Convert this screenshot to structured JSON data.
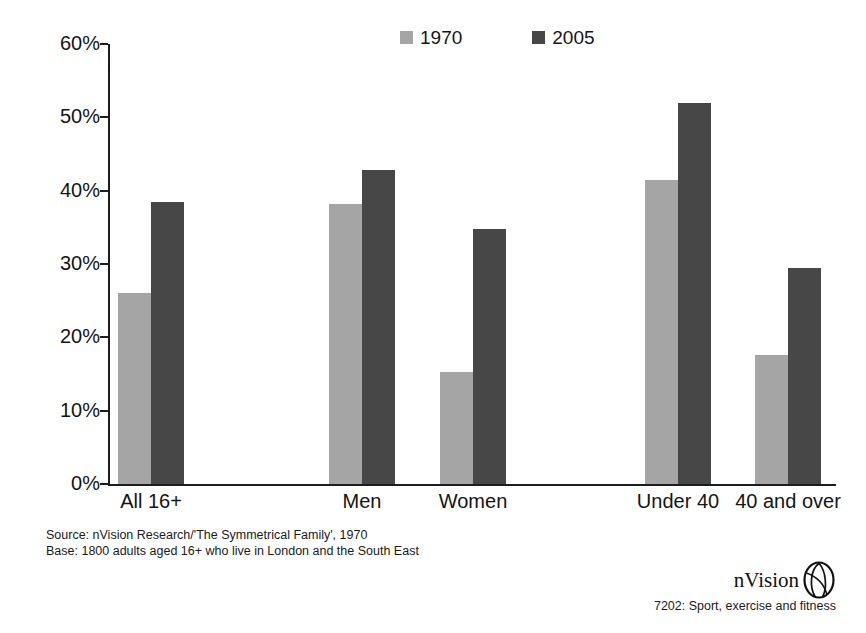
{
  "chart_data": {
    "type": "bar",
    "title": "",
    "subtitle": "",
    "xlabel": "",
    "ylabel": "",
    "ylim": [
      0,
      60
    ],
    "ytick_labels": [
      "0%",
      "10%",
      "20%",
      "30%",
      "40%",
      "50%",
      "60%"
    ],
    "ytick_values": [
      0,
      10,
      20,
      30,
      40,
      50,
      60
    ],
    "grid": false,
    "legend_position": "top-center",
    "categories": [
      "All 16+",
      "Men",
      "Women",
      "Under 40",
      "40 and over"
    ],
    "series": [
      {
        "name": "1970",
        "color": "#a5a5a5",
        "values": [
          26.0,
          38.2,
          15.3,
          41.5,
          17.6
        ]
      },
      {
        "name": "2005",
        "color": "#474747",
        "values": [
          38.5,
          42.8,
          34.8,
          52.0,
          29.5
        ]
      }
    ]
  },
  "legend": {
    "entries": [
      {
        "label": "1970",
        "color": "#a5a5a5"
      },
      {
        "label": "2005",
        "color": "#474747"
      }
    ]
  },
  "axis": {
    "y_labels": [
      "60%",
      "50%",
      "40%",
      "30%",
      "20%",
      "10%",
      "0%"
    ],
    "x_labels": [
      "All 16+",
      "Men",
      "Women",
      "Under 40",
      "40 and over"
    ]
  },
  "footer": {
    "source_line": "Source: nVision Research/'The Symmetrical Family', 1970",
    "base_line": "Base: 1800 adults aged 16+ who live in London and the South East",
    "brand_name": "nVision",
    "brand_caption": "7202: Sport, exercise and fitness"
  }
}
